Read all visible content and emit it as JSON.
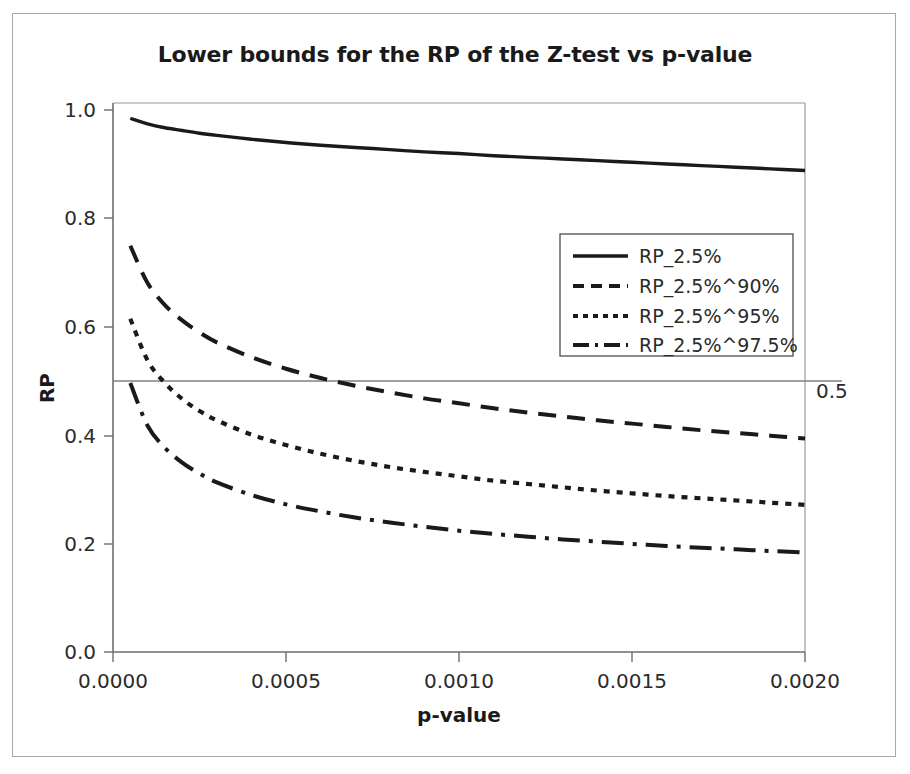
{
  "chart_data": {
    "type": "line",
    "title": "Lower bounds for the RP of the Z-test vs p-value",
    "xlabel": "p-value",
    "ylabel": "RP",
    "xlim": [
      0.0,
      0.002
    ],
    "ylim": [
      0.0,
      1.0
    ],
    "xticks": [
      "0.0000",
      "0.0005",
      "0.0010",
      "0.0015",
      "0.0020"
    ],
    "xtick_values": [
      0.0,
      0.0005,
      0.001,
      0.0015,
      0.002
    ],
    "yticks": [
      "0.0",
      "0.2",
      "0.4",
      "0.6",
      "0.8",
      "1.0"
    ],
    "ytick_values": [
      0.0,
      0.2,
      0.4,
      0.6,
      0.8,
      1.0
    ],
    "grid": false,
    "legend_position": "center-right",
    "reference_line": {
      "value": 0.5,
      "label": "0.5",
      "orientation": "horizontal",
      "color": "#808080"
    },
    "x": [
      5e-05,
      0.0001,
      0.00015,
      0.0002,
      0.00025,
      0.0003,
      0.0004,
      0.0005,
      0.0006,
      0.0007,
      0.0008,
      0.0009,
      0.001,
      0.0011,
      0.0012,
      0.0013,
      0.0014,
      0.0015,
      0.0016,
      0.0017,
      0.0018,
      0.0019,
      0.002
    ],
    "series": [
      {
        "name": "RP_2.5%",
        "style": "solid",
        "color": "#1a1a1a",
        "values": [
          0.972,
          0.962,
          0.955,
          0.95,
          0.945,
          0.941,
          0.934,
          0.928,
          0.923,
          0.919,
          0.915,
          0.911,
          0.908,
          0.904,
          0.901,
          0.898,
          0.895,
          0.892,
          0.889,
          0.886,
          0.883,
          0.88,
          0.877
        ]
      },
      {
        "name": "RP_2.5%^90%",
        "style": "dashed",
        "color": "#1a1a1a",
        "values": [
          0.74,
          0.672,
          0.632,
          0.604,
          0.582,
          0.564,
          0.537,
          0.516,
          0.499,
          0.485,
          0.473,
          0.462,
          0.453,
          0.444,
          0.436,
          0.429,
          0.422,
          0.416,
          0.41,
          0.404,
          0.399,
          0.394,
          0.389
        ]
      },
      {
        "name": "RP_2.5%^95%",
        "style": "dotted",
        "color": "#1a1a1a",
        "values": [
          0.607,
          0.531,
          0.49,
          0.461,
          0.439,
          0.422,
          0.396,
          0.377,
          0.361,
          0.348,
          0.337,
          0.328,
          0.32,
          0.312,
          0.306,
          0.3,
          0.294,
          0.289,
          0.284,
          0.28,
          0.276,
          0.272,
          0.268
        ]
      },
      {
        "name": "RP_2.5%^97.5%",
        "style": "dashdot",
        "color": "#1a1a1a",
        "values": [
          0.49,
          0.412,
          0.372,
          0.345,
          0.325,
          0.309,
          0.286,
          0.269,
          0.256,
          0.245,
          0.236,
          0.228,
          0.221,
          0.215,
          0.21,
          0.205,
          0.201,
          0.197,
          0.193,
          0.19,
          0.187,
          0.184,
          0.181
        ]
      }
    ]
  },
  "legend": {
    "entries": [
      {
        "label": "RP_2.5%"
      },
      {
        "label": "RP_2.5%^90%"
      },
      {
        "label": "RP_2.5%^95%"
      },
      {
        "label": "RP_2.5%^97.5%"
      }
    ]
  },
  "colors": {
    "line": "#1a1a1a",
    "axis": "#808080",
    "frame": "#a8a8a8",
    "text": "#1a1a1a",
    "background": "#ffffff"
  }
}
